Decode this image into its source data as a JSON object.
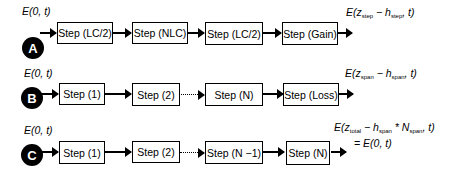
{
  "rows": [
    {
      "id": "A",
      "input_label": "E(0, t)",
      "steps": [
        "Step (LC/2)",
        "Step (NLC)",
        "Step (LC/2)",
        "Step (Gain)"
      ],
      "output_label": {
        "base": "E(z",
        "sub1": "step",
        "mid": " − h",
        "sub2": "step",
        "end": ", t)"
      }
    },
    {
      "id": "B",
      "input_label": "E(0, t)",
      "steps": [
        "Step (1)",
        "Step (2)",
        "Step (N)",
        "Step (Loss)"
      ],
      "connector_between_2_and_3": "dotted",
      "output_label": {
        "base": "E(z",
        "sub1": "span",
        "mid": " − h",
        "sub2": "span",
        "end": ", t)"
      }
    },
    {
      "id": "C",
      "input_label": "E(0, t)",
      "steps": [
        "Step (1)",
        "Step (2)",
        "Step (N −1)",
        "Step (N)"
      ],
      "connector_between_2_and_3": "dotted",
      "output_label": {
        "base": "E(z",
        "sub1": "total",
        "mid": " − h",
        "sub2": "span",
        "mid2": " * N",
        "sub3": "span",
        "end": ", t)",
        "line2": "= E(0, t)"
      }
    }
  ]
}
